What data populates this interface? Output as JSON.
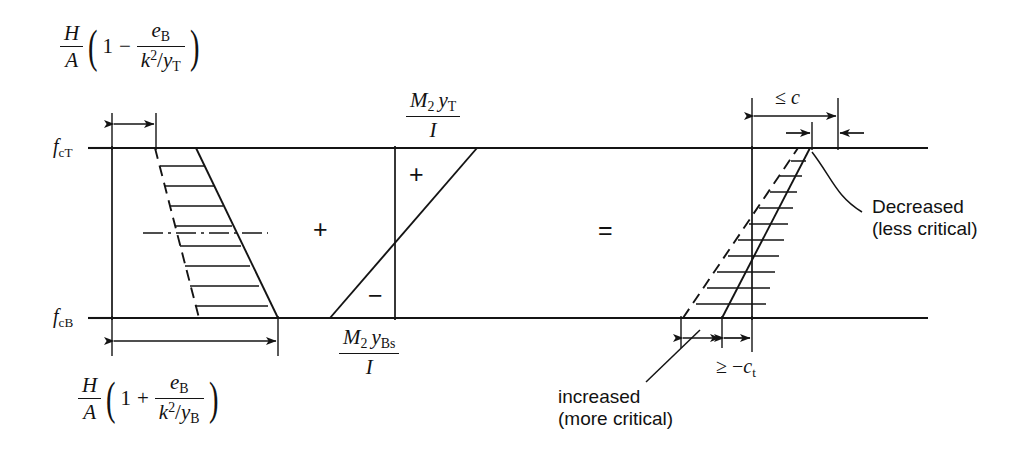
{
  "figure": {
    "type": "engineering-stress-diagram"
  },
  "axis_labels": {
    "top": "f_cT",
    "top_parts": {
      "base": "f",
      "sub": "cT"
    },
    "bottom": "f_cB",
    "bottom_parts": {
      "base": "f",
      "sub": "cB"
    }
  },
  "formulas": {
    "top_left": {
      "text": "(H/A)(1 - e_B/(k^2/y_T))",
      "lead_num": "H",
      "lead_den": "A",
      "operator": "−",
      "one": "1",
      "inner_num_base": "e",
      "inner_num_sub": "B",
      "inner_den_k": "k",
      "inner_den_exp": "2",
      "inner_den_slash": "/",
      "inner_den_y": "y",
      "inner_den_sub": "T"
    },
    "bottom_left": {
      "text": "(H/A)(1 + e_B/(k^2/y_B))",
      "lead_num": "H",
      "lead_den": "A",
      "operator": "+",
      "one": "1",
      "inner_num_base": "e",
      "inner_num_sub": "B",
      "inner_den_k": "k",
      "inner_den_exp": "2",
      "inner_den_slash": "/",
      "inner_den_y": "y",
      "inner_den_sub": "B"
    },
    "top_middle": {
      "text": "M_2 y_T / I",
      "num_m": "M",
      "num_m_sub": "2",
      "num_y": "y",
      "num_y_sub": "T",
      "den": "I"
    },
    "bottom_middle": {
      "text": "M_2 y_Bs / I",
      "num_m": "M",
      "num_m_sub": "2",
      "num_y": "y",
      "num_y_sub": "Bs",
      "den": "I"
    }
  },
  "operators": {
    "plus_between_diagrams": "+",
    "equals_between_diagrams": "=",
    "middle_upper_sign": "+",
    "middle_lower_sign": "−"
  },
  "dimensions": {
    "top_right": "≤ c",
    "top_right_parts": {
      "symbol": "≤",
      "value": "c"
    },
    "bottom_right": "≥ − c_t",
    "bottom_right_parts": {
      "symbol": "≥",
      "minus": "−",
      "base": "c",
      "sub": "t"
    }
  },
  "annotations": {
    "decreased": {
      "line1": "Decreased",
      "line2": "(less critical)"
    },
    "increased": {
      "line1": "increased",
      "line2": "(more critical)"
    }
  },
  "colors": {
    "ink": "#141414",
    "background": "#ffffff"
  }
}
